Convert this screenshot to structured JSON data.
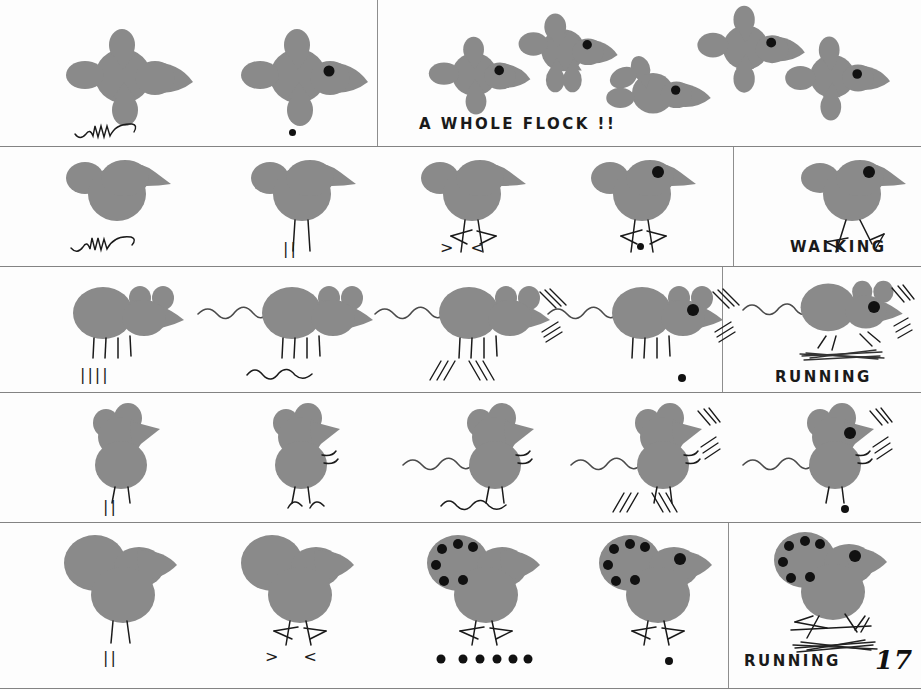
{
  "page": {
    "number": "17",
    "background_color": "#fdfdfd",
    "ink_color": "#1a1a1a",
    "shape_fill": "#8a8a8a",
    "rule_color": "#7a7a7a",
    "eye_color": "#111111"
  },
  "labels": {
    "flock": "A WHOLE FLOCK !!",
    "walking": "WALKING",
    "running_mouse": "RUNNING",
    "running_chick": "RUNNING"
  },
  "rows": [
    {
      "id": "row-flying-bird",
      "subject": "flying-bird",
      "steps": [
        {
          "id": "step-1",
          "annotation_type": "squiggle",
          "annotation_text": "",
          "has_eye": false
        },
        {
          "id": "step-2",
          "annotation_type": "dot",
          "annotation_text": "",
          "has_eye": true
        }
      ],
      "panel": {
        "id": "flock-panel",
        "caption": "A WHOLE FLOCK !!",
        "bird_count": 5
      }
    },
    {
      "id": "row-standing-bird",
      "subject": "standing-bird",
      "steps": [
        {
          "id": "step-1",
          "annotation_type": "squiggle",
          "annotation_text": "",
          "has_eye": false,
          "has_legs": false
        },
        {
          "id": "step-2",
          "annotation_type": "legs",
          "annotation_text": "||",
          "has_eye": false,
          "has_legs": true
        },
        {
          "id": "step-3",
          "annotation_type": "feet",
          "annotation_text": "> <",
          "has_eye": false,
          "has_legs": true
        },
        {
          "id": "step-4",
          "annotation_type": "dot",
          "annotation_text": "",
          "has_eye": true,
          "has_legs": true
        }
      ],
      "panel": {
        "id": "walking-panel",
        "caption": "WALKING",
        "has_motion_lines": false
      }
    },
    {
      "id": "row-running-mouse",
      "subject": "side-mouse",
      "steps": [
        {
          "id": "step-1",
          "annotation_type": "legs",
          "annotation_text": "||||",
          "has_eye": false,
          "has_tail": false,
          "has_whiskers": false
        },
        {
          "id": "step-2",
          "annotation_type": "squiggle-tail",
          "annotation_text": "",
          "has_eye": false,
          "has_tail": true,
          "has_whiskers": false
        },
        {
          "id": "step-3",
          "annotation_type": "whiskers",
          "annotation_text": "/// \\\\\\",
          "has_eye": false,
          "has_tail": true,
          "has_whiskers": true
        },
        {
          "id": "step-4",
          "annotation_type": "dot",
          "annotation_text": "",
          "has_eye": true,
          "has_tail": true,
          "has_whiskers": true
        }
      ],
      "panel": {
        "id": "running-mouse-panel",
        "caption": "RUNNING",
        "has_motion_lines": true
      }
    },
    {
      "id": "row-standing-mouse",
      "subject": "front-mouse",
      "steps": [
        {
          "id": "step-1",
          "annotation_type": "legs",
          "annotation_text": "||",
          "has_eye": false,
          "has_arms": false,
          "has_tail": false,
          "has_whiskers": false
        },
        {
          "id": "step-2",
          "annotation_type": "arms",
          "annotation_text": "",
          "has_eye": false,
          "has_arms": true,
          "has_tail": false,
          "has_whiskers": false
        },
        {
          "id": "step-3",
          "annotation_type": "squiggle-tail",
          "annotation_text": "",
          "has_eye": false,
          "has_arms": true,
          "has_tail": true,
          "has_whiskers": false
        },
        {
          "id": "step-4",
          "annotation_type": "whiskers",
          "annotation_text": "/// \\\\\\",
          "has_eye": false,
          "has_arms": true,
          "has_tail": true,
          "has_whiskers": true
        },
        {
          "id": "step-5",
          "annotation_type": "dot",
          "annotation_text": "",
          "has_eye": true,
          "has_arms": true,
          "has_tail": true,
          "has_whiskers": true
        }
      ],
      "panel": null
    },
    {
      "id": "row-spotted-chick",
      "subject": "spotted-chick",
      "steps": [
        {
          "id": "step-1",
          "annotation_type": "legs",
          "annotation_text": "||",
          "has_eye": false,
          "has_spots": false,
          "spot_count": 0
        },
        {
          "id": "step-2",
          "annotation_type": "feet",
          "annotation_text": "> <",
          "has_eye": false,
          "has_spots": false,
          "spot_count": 0
        },
        {
          "id": "step-3",
          "annotation_type": "dots",
          "annotation_text": "",
          "has_eye": false,
          "has_spots": true,
          "spot_count": 6,
          "annotation_dot_count": 6
        },
        {
          "id": "step-4",
          "annotation_type": "dot",
          "annotation_text": "",
          "has_eye": true,
          "has_spots": true,
          "spot_count": 6
        }
      ],
      "panel": {
        "id": "running-chick-panel",
        "caption": "RUNNING",
        "has_motion_lines": true,
        "page_number": "17"
      }
    }
  ]
}
